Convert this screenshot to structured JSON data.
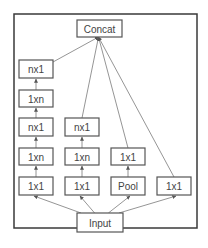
{
  "diagram": {
    "nodes": [
      {
        "id": "concat",
        "label": "Concat"
      },
      {
        "id": "c1_nx1_top",
        "label": "nx1"
      },
      {
        "id": "c1_1xn_top",
        "label": "1xn"
      },
      {
        "id": "c1_nx1_mid",
        "label": "nx1"
      },
      {
        "id": "c1_1xn_bot",
        "label": "1xn"
      },
      {
        "id": "c1_1x1",
        "label": "1x1"
      },
      {
        "id": "c2_nx1",
        "label": "nx1"
      },
      {
        "id": "c2_1xn",
        "label": "1xn"
      },
      {
        "id": "c2_1x1",
        "label": "1x1"
      },
      {
        "id": "c3_1x1",
        "label": "1x1"
      },
      {
        "id": "c3_pool",
        "label": "Pool"
      },
      {
        "id": "c4_1x1",
        "label": "1x1"
      },
      {
        "id": "input",
        "label": "Input"
      }
    ],
    "edges": [
      [
        "input",
        "c1_1x1"
      ],
      [
        "input",
        "c2_1x1"
      ],
      [
        "input",
        "c3_pool"
      ],
      [
        "input",
        "c4_1x1"
      ],
      [
        "c1_1x1",
        "c1_1xn_bot"
      ],
      [
        "c1_1xn_bot",
        "c1_nx1_mid"
      ],
      [
        "c1_nx1_mid",
        "c1_1xn_top"
      ],
      [
        "c1_1xn_top",
        "c1_nx1_top"
      ],
      [
        "c2_1x1",
        "c2_1xn"
      ],
      [
        "c2_1xn",
        "c2_nx1"
      ],
      [
        "c3_pool",
        "c3_1x1"
      ],
      [
        "c1_nx1_top",
        "concat"
      ],
      [
        "c2_nx1",
        "concat"
      ],
      [
        "c3_1x1",
        "concat"
      ],
      [
        "c4_1x1",
        "concat"
      ]
    ]
  }
}
